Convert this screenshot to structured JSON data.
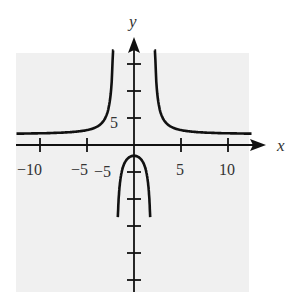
{
  "chart_data": {
    "type": "line",
    "title": "",
    "xlabel": "x",
    "ylabel": "y",
    "function_estimate": "y = 2(x^2 + 4)/(x^2 - 4)",
    "vertical_asymptotes": [
      -2,
      2
    ],
    "horizontal_asymptote": 2,
    "xlim": [
      -12.5,
      12.5
    ],
    "ylim": [
      -25,
      17
    ],
    "x_ticks": [
      -10,
      -5,
      5,
      10
    ],
    "x_tick_labels": [
      "−10",
      "−5",
      "5",
      "10"
    ],
    "y_ticks": [
      -25,
      -20,
      -15,
      -10,
      -5,
      5,
      10,
      15
    ],
    "y_tick_labels_shown": {
      "5": "5",
      "-5": "−5"
    },
    "grid": false,
    "legend": null,
    "series": [
      {
        "name": "left branch",
        "x": [
          -12.5,
          -10,
          -7.5,
          -5,
          -4,
          -3,
          -2.5,
          -2.2
        ],
        "y": [
          2.1,
          2.17,
          2.3,
          2.76,
          3.33,
          5.2,
          8.2,
          17
        ]
      },
      {
        "name": "middle branch",
        "x": [
          -1.6,
          -1.5,
          -1,
          -0.5,
          0,
          0.5,
          1,
          1.5,
          1.6
        ],
        "y": [
          -25,
          -17.7,
          -3.3,
          -2.27,
          -2,
          -2.27,
          -3.3,
          -17.7,
          -25
        ]
      },
      {
        "name": "right branch",
        "x": [
          2.2,
          2.5,
          3,
          4,
          5,
          7.5,
          10,
          12.5
        ],
        "y": [
          17,
          8.2,
          5.2,
          3.33,
          2.76,
          2.3,
          2.17,
          2.1
        ]
      }
    ]
  },
  "labels": {
    "x_axis": "x",
    "y_axis": "y",
    "y_tick_5": "5",
    "y_tick_neg5": "−5",
    "x_tick_neg10": "−10",
    "x_tick_neg5": "−5",
    "x_tick_5": "5",
    "x_tick_10": "10"
  },
  "colors": {
    "panel": "#f0f0f0",
    "ink": "#111111"
  }
}
